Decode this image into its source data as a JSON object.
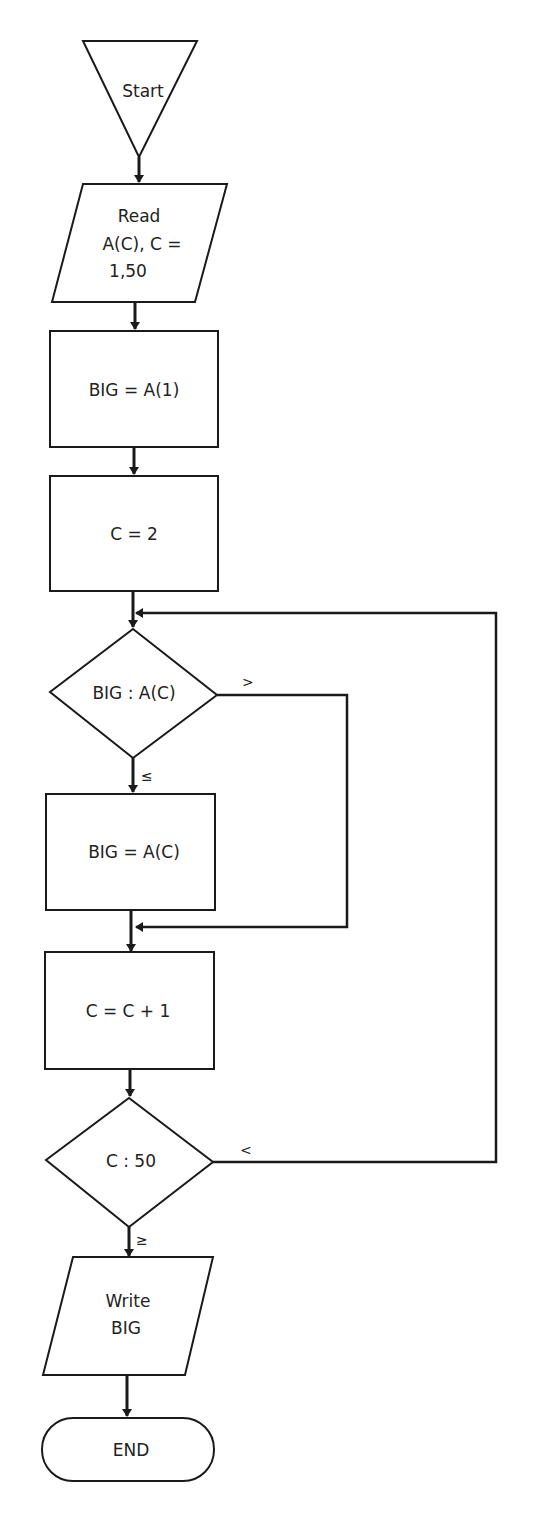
{
  "diagram": {
    "type": "flowchart",
    "nodes": {
      "start": {
        "shape": "inverted-triangle",
        "label": "Start"
      },
      "read": {
        "shape": "parallelogram",
        "lines": [
          "Read",
          "A(C), C =",
          "1,50"
        ]
      },
      "init_big": {
        "shape": "rectangle",
        "label": "BIG = A(1)"
      },
      "init_c": {
        "shape": "rectangle",
        "label": "C = 2"
      },
      "compare_big": {
        "shape": "diamond",
        "label": "BIG : A(C)"
      },
      "assign_big": {
        "shape": "rectangle",
        "label": "BIG = A(C)"
      },
      "increment": {
        "shape": "rectangle",
        "label": "C = C + 1"
      },
      "compare_c": {
        "shape": "diamond",
        "label": "C : 50"
      },
      "write": {
        "shape": "parallelogram",
        "lines": [
          "Write",
          "BIG"
        ]
      },
      "end": {
        "shape": "terminator",
        "label": "END"
      }
    },
    "branch_labels": {
      "compare_big_greater": ">",
      "compare_big_less_equal": "≤",
      "compare_c_less": "<",
      "compare_c_greater_equal": "≥"
    },
    "edges": [
      {
        "from": "start",
        "to": "read"
      },
      {
        "from": "read",
        "to": "init_big"
      },
      {
        "from": "init_big",
        "to": "init_c"
      },
      {
        "from": "init_c",
        "to": "compare_big"
      },
      {
        "from": "compare_big",
        "to": "assign_big",
        "label": "≤"
      },
      {
        "from": "compare_big",
        "to": "increment",
        "label": ">"
      },
      {
        "from": "assign_big",
        "to": "increment"
      },
      {
        "from": "increment",
        "to": "compare_c"
      },
      {
        "from": "compare_c",
        "to": "compare_big",
        "label": "<"
      },
      {
        "from": "compare_c",
        "to": "write",
        "label": "≥"
      },
      {
        "from": "write",
        "to": "end"
      }
    ]
  }
}
